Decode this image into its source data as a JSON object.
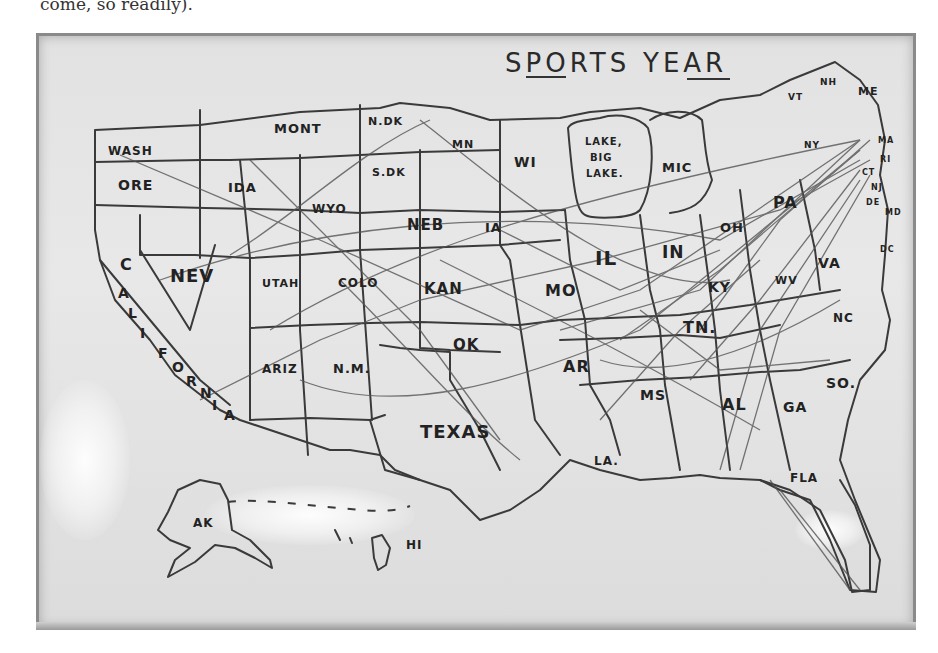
{
  "caption": "come, so readily).",
  "whiteboard": {
    "title_words": [
      "SPORTS",
      "YEAR"
    ],
    "states": [
      {
        "label": "WASH",
        "x": 108,
        "y": 155,
        "size": 12
      },
      {
        "label": "ORE",
        "x": 118,
        "y": 190,
        "size": 14
      },
      {
        "label": "IDA",
        "x": 228,
        "y": 192,
        "size": 13
      },
      {
        "label": "MONT",
        "x": 274,
        "y": 133,
        "size": 13
      },
      {
        "label": "N.DK",
        "x": 368,
        "y": 125,
        "size": 11
      },
      {
        "label": "S.DK",
        "x": 372,
        "y": 176,
        "size": 11
      },
      {
        "label": "MN",
        "x": 452,
        "y": 148,
        "size": 11
      },
      {
        "label": "WI",
        "x": 514,
        "y": 167,
        "size": 14
      },
      {
        "label": "LAKE,",
        "x": 585,
        "y": 145,
        "size": 10
      },
      {
        "label": "BIG",
        "x": 590,
        "y": 161,
        "size": 10
      },
      {
        "label": "LAKE.",
        "x": 586,
        "y": 177,
        "size": 10
      },
      {
        "label": "MIC",
        "x": 662,
        "y": 172,
        "size": 13
      },
      {
        "label": "WYO",
        "x": 312,
        "y": 213,
        "size": 12
      },
      {
        "label": "NEB",
        "x": 407,
        "y": 230,
        "size": 15
      },
      {
        "label": "IA",
        "x": 485,
        "y": 232,
        "size": 13
      },
      {
        "label": "IL",
        "x": 595,
        "y": 265,
        "size": 20
      },
      {
        "label": "IN",
        "x": 662,
        "y": 258,
        "size": 17
      },
      {
        "label": "OH",
        "x": 720,
        "y": 232,
        "size": 13
      },
      {
        "label": "PA",
        "x": 773,
        "y": 208,
        "size": 16
      },
      {
        "label": "NY",
        "x": 804,
        "y": 148,
        "size": 9
      },
      {
        "label": "VT",
        "x": 788,
        "y": 100,
        "size": 9
      },
      {
        "label": "NH",
        "x": 820,
        "y": 85,
        "size": 9
      },
      {
        "label": "ME",
        "x": 858,
        "y": 95,
        "size": 11
      },
      {
        "label": "MA",
        "x": 878,
        "y": 143,
        "size": 8
      },
      {
        "label": "RI",
        "x": 880,
        "y": 162,
        "size": 8
      },
      {
        "label": "CT",
        "x": 862,
        "y": 175,
        "size": 8
      },
      {
        "label": "NJ",
        "x": 871,
        "y": 190,
        "size": 8
      },
      {
        "label": "DE",
        "x": 866,
        "y": 205,
        "size": 8
      },
      {
        "label": "MD",
        "x": 885,
        "y": 215,
        "size": 8
      },
      {
        "label": "DC",
        "x": 880,
        "y": 252,
        "size": 8
      },
      {
        "label": "C",
        "x": 120,
        "y": 270,
        "size": 16
      },
      {
        "label": "NEV",
        "x": 170,
        "y": 282,
        "size": 18
      },
      {
        "label": "UTAH",
        "x": 262,
        "y": 287,
        "size": 11
      },
      {
        "label": "COLO",
        "x": 338,
        "y": 287,
        "size": 12
      },
      {
        "label": "KAN",
        "x": 424,
        "y": 294,
        "size": 15
      },
      {
        "label": "MO",
        "x": 545,
        "y": 296,
        "size": 16
      },
      {
        "label": "KY",
        "x": 708,
        "y": 292,
        "size": 14
      },
      {
        "label": "WV",
        "x": 775,
        "y": 284,
        "size": 11
      },
      {
        "label": "VA",
        "x": 818,
        "y": 268,
        "size": 14
      },
      {
        "label": "TN.",
        "x": 683,
        "y": 333,
        "size": 16
      },
      {
        "label": "NC",
        "x": 833,
        "y": 322,
        "size": 12
      },
      {
        "label": "ARIZ",
        "x": 262,
        "y": 373,
        "size": 12
      },
      {
        "label": "N.M.",
        "x": 333,
        "y": 373,
        "size": 13
      },
      {
        "label": "OK",
        "x": 453,
        "y": 350,
        "size": 15
      },
      {
        "label": "AR",
        "x": 563,
        "y": 372,
        "size": 16
      },
      {
        "label": "MS",
        "x": 640,
        "y": 400,
        "size": 14
      },
      {
        "label": "AL",
        "x": 722,
        "y": 410,
        "size": 16
      },
      {
        "label": "GA",
        "x": 783,
        "y": 412,
        "size": 14
      },
      {
        "label": "SO.",
        "x": 826,
        "y": 388,
        "size": 14
      },
      {
        "label": "TEXAS",
        "x": 420,
        "y": 438,
        "size": 18
      },
      {
        "label": "LA.",
        "x": 594,
        "y": 465,
        "size": 12
      },
      {
        "label": "FLA",
        "x": 790,
        "y": 482,
        "size": 12
      },
      {
        "label": "AK",
        "x": 193,
        "y": 527,
        "size": 12
      },
      {
        "label": "HI",
        "x": 406,
        "y": 549,
        "size": 12
      }
    ],
    "california_letters": [
      "A",
      "L",
      "I",
      "F",
      "O",
      "R",
      "N",
      "I",
      "A"
    ]
  }
}
